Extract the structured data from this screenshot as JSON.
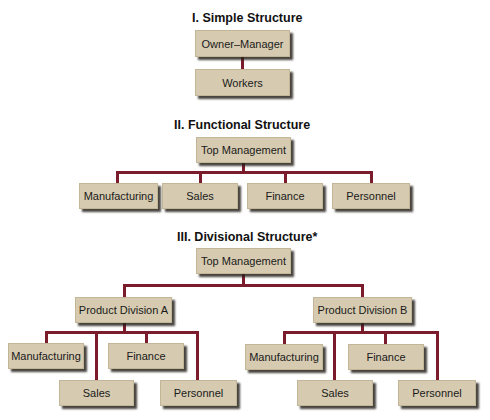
{
  "colors": {
    "box_fill": "#d6cbb0",
    "connector": "#7a1c2c",
    "title": "#111111"
  },
  "simple": {
    "title": "I. Simple Structure",
    "top": "Owner–Manager",
    "child": "Workers"
  },
  "functional": {
    "title": "II. Functional Structure",
    "top": "Top Management",
    "children": [
      "Manufacturing",
      "Sales",
      "Finance",
      "Personnel"
    ]
  },
  "divisional": {
    "title": "III. Divisional Structure*",
    "top": "Top Management",
    "divisions": [
      {
        "label": "Product Division A",
        "children": [
          "Manufacturing",
          "Finance",
          "Sales",
          "Personnel"
        ]
      },
      {
        "label": "Product Division B",
        "children": [
          "Manufacturing",
          "Finance",
          "Sales",
          "Personnel"
        ]
      }
    ]
  }
}
